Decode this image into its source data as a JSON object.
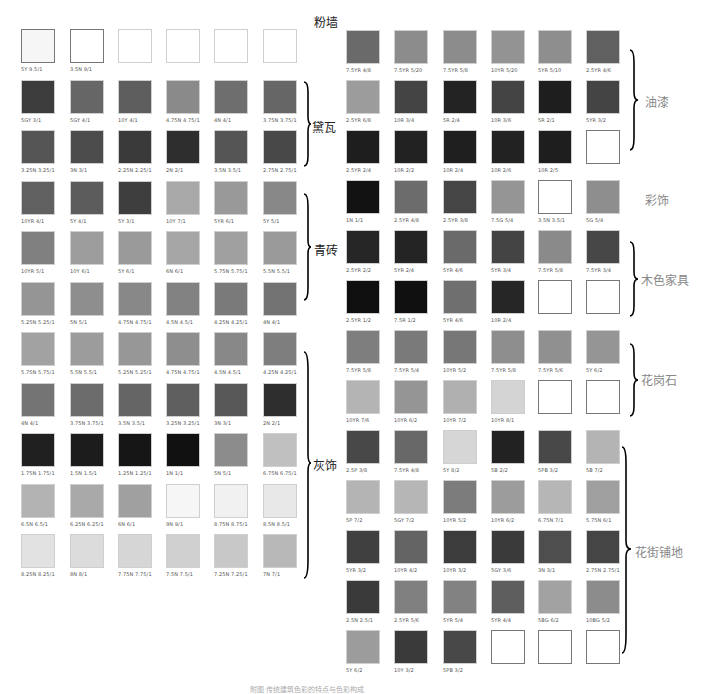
{
  "left_grid": {
    "rows": [
      [
        {
          "code": "5Y 9.5/1",
          "color": "#f6f6f6",
          "outlined": true
        },
        {
          "code": "3.5N 9/1",
          "color": "#ffffff",
          "outlined": true
        },
        {
          "code": "",
          "color": "#ffffff"
        },
        {
          "code": "",
          "color": "#ffffff"
        },
        {
          "code": "",
          "color": "#ffffff"
        },
        {
          "code": "",
          "color": "#ffffff"
        }
      ],
      [
        {
          "code": "5GY 3/1",
          "color": "#3c3c3c"
        },
        {
          "code": "5GY 4/1",
          "color": "#666666"
        },
        {
          "code": "10Y 4/1",
          "color": "#5e5e5e"
        },
        {
          "code": "4.75N 4.75/1",
          "color": "#8a8a8a"
        },
        {
          "code": "4N 4/1",
          "color": "#6e6e6e"
        },
        {
          "code": "3.75N 3.75/1",
          "color": "#666666"
        }
      ],
      [
        {
          "code": "3.25N 3.25/1",
          "color": "#555555"
        },
        {
          "code": "3N 3/1",
          "color": "#4c4c4c"
        },
        {
          "code": "2.25N 2.25/1",
          "color": "#3a3a3a"
        },
        {
          "code": "2N 2/1",
          "color": "#2e2e2e"
        },
        {
          "code": "3.5N 3.5/1",
          "color": "#555555"
        },
        {
          "code": "2.75N 2.75/1",
          "color": "#484848"
        }
      ],
      [
        {
          "code": "10YR 4/1",
          "color": "#606060"
        },
        {
          "code": "5Y 4/1",
          "color": "#5c5c5c"
        },
        {
          "code": "5Y 3/1",
          "color": "#3e3e3e"
        },
        {
          "code": "10Y 7/1",
          "color": "#a8a8a8"
        },
        {
          "code": "5YR 6/1",
          "color": "#999999"
        },
        {
          "code": "5Y 5/1",
          "color": "#888888"
        }
      ],
      [
        {
          "code": "10YR 5/1",
          "color": "#808080"
        },
        {
          "code": "10Y 6/1",
          "color": "#9d9d9d"
        },
        {
          "code": "5Y 6/1",
          "color": "#9a9a9a"
        },
        {
          "code": "6N 6/1",
          "color": "#a6a6a6"
        },
        {
          "code": "5.75N 5.75/1",
          "color": "#a0a0a0"
        },
        {
          "code": "5.5N 5.5/1",
          "color": "#9a9a9a"
        }
      ],
      [
        {
          "code": "5.25N 5.25/1",
          "color": "#959595"
        },
        {
          "code": "5N 5/1",
          "color": "#8e8e8e"
        },
        {
          "code": "4.75N 4.75/1",
          "color": "#888888"
        },
        {
          "code": "4.5N 4.5/1",
          "color": "#828282"
        },
        {
          "code": "4.25N 4.25/1",
          "color": "#7a7a7a"
        },
        {
          "code": "4N 4/1",
          "color": "#727272"
        }
      ],
      [
        {
          "code": "5.75N 5.75/1",
          "color": "#a2a2a2"
        },
        {
          "code": "5.5N 5.5/1",
          "color": "#9c9c9c"
        },
        {
          "code": "5.25N 5.25/1",
          "color": "#979797"
        },
        {
          "code": "4.75N 4.75/1",
          "color": "#8e8e8e"
        },
        {
          "code": "4.5N 4.5/1",
          "color": "#888888"
        },
        {
          "code": "4.25N 4.25/1",
          "color": "#7e7e7e"
        }
      ],
      [
        {
          "code": "4N 4/1",
          "color": "#747474"
        },
        {
          "code": "3.75N 3.75/1",
          "color": "#6c6c6c"
        },
        {
          "code": "3.5N 3.5/1",
          "color": "#656565"
        },
        {
          "code": "3.25N 3.25/1",
          "color": "#5f5f5f"
        },
        {
          "code": "3N 3/1",
          "color": "#575757"
        },
        {
          "code": "2N 2/1",
          "color": "#2e2e2e"
        }
      ],
      [
        {
          "code": "1.75N 1.75/1",
          "color": "#202020"
        },
        {
          "code": "1.5N 1.5/1",
          "color": "#1c1c1c"
        },
        {
          "code": "1.25N 1.25/1",
          "color": "#161616"
        },
        {
          "code": "1N 1/1",
          "color": "#111111"
        },
        {
          "code": "5N 5/1",
          "color": "#8c8c8c"
        },
        {
          "code": "6.75N 6.75/1",
          "color": "#c0c0c0"
        }
      ],
      [
        {
          "code": "6.5N 6.5/1",
          "color": "#b3b3b3"
        },
        {
          "code": "6.25N 6.25/1",
          "color": "#a9a9a9"
        },
        {
          "code": "6N 6/1",
          "color": "#a0a0a0"
        },
        {
          "code": "9N 9/1",
          "color": "#f6f6f6"
        },
        {
          "code": "8.75N 8.75/1",
          "color": "#f1f1f1"
        },
        {
          "code": "8.5N 8.5/1",
          "color": "#e8e8e8"
        }
      ],
      [
        {
          "code": "8.25N 8.25/1",
          "color": "#e2e2e2"
        },
        {
          "code": "8N 8/1",
          "color": "#dcdcdc"
        },
        {
          "code": "7.75N 7.75/1",
          "color": "#d6d6d6"
        },
        {
          "code": "7.5N 7.5/1",
          "color": "#d0d0d0"
        },
        {
          "code": "7.25N 7.25/1",
          "color": "#c8c8c8"
        },
        {
          "code": "7N 7/1",
          "color": "#b8b8b8"
        }
      ]
    ],
    "labels": [
      {
        "text": "粉墙",
        "row": 0
      },
      {
        "text": "黛瓦",
        "row": 1.5
      },
      {
        "text": "青砖",
        "row": 4
      },
      {
        "text": "灰饰",
        "row": 8
      }
    ]
  },
  "right_grid": {
    "rows": [
      [
        {
          "code": "7.5YR 4/8",
          "color": "#6a6a6a"
        },
        {
          "code": "7.5YR 5/20",
          "color": "#8c8c8c"
        },
        {
          "code": "7.5YR 5/8",
          "color": "#8c8c8c"
        },
        {
          "code": "10YR 5/20",
          "color": "#939393"
        },
        {
          "code": "5YR 5/10",
          "color": "#8e8e8e"
        },
        {
          "code": "2.5YR 4/6",
          "color": "#606060"
        }
      ],
      [
        {
          "code": "2.5YR 6/8",
          "color": "#9c9c9c"
        },
        {
          "code": "10R 3/4",
          "color": "#444444"
        },
        {
          "code": "5R 2/4",
          "color": "#232323"
        },
        {
          "code": "10R 3/6",
          "color": "#444444"
        },
        {
          "code": "5R 2/1",
          "color": "#1e1e1e"
        },
        {
          "code": "5YR 3/2",
          "color": "#444444"
        }
      ],
      [
        {
          "code": "2.5YR 2/4",
          "color": "#1e1e1e"
        },
        {
          "code": "10R 2/2",
          "color": "#222222"
        },
        {
          "code": "10R 2/4",
          "color": "#1f1f1f"
        },
        {
          "code": "10R 2/6",
          "color": "#222222"
        },
        {
          "code": "10R 2/5",
          "color": "#1e1e1e"
        },
        {
          "code": "",
          "color": "#ffffff",
          "outlined": true
        }
      ],
      [
        {
          "code": "1N 1/1",
          "color": "#121212"
        },
        {
          "code": "2.5YR 4/8",
          "color": "#6c6c6c"
        },
        {
          "code": "2.5YR 3/8",
          "color": "#454545"
        },
        {
          "code": "7.5G 5/4",
          "color": "#959595"
        },
        {
          "code": "3.5N 3.5/1",
          "color": "#ffffff",
          "outlined": true
        },
        {
          "code": "5G 5/4",
          "color": "#8e8e8e"
        }
      ],
      [
        {
          "code": "2.5YR 2/2",
          "color": "#262626"
        },
        {
          "code": "5YR 2/4",
          "color": "#242424"
        },
        {
          "code": "5YR 4/6",
          "color": "#6a6a6a"
        },
        {
          "code": "5YR 3/4",
          "color": "#444444"
        },
        {
          "code": "7.5YR 5/8",
          "color": "#8a8a8a"
        },
        {
          "code": "7.5YR 3/4",
          "color": "#474747"
        }
      ],
      [
        {
          "code": "2.5YR 1/2",
          "color": "#0f0f0f"
        },
        {
          "code": "7.5R 1/2",
          "color": "#101010"
        },
        {
          "code": "5YR 4/6",
          "color": "#6f6f6f"
        },
        {
          "code": "10R 2/4",
          "color": "#262626"
        },
        {
          "code": "",
          "color": "#ffffff",
          "outlined": true
        },
        {
          "code": "",
          "color": "#ffffff",
          "outlined": true
        }
      ],
      [
        {
          "code": "7.5YR 5/8",
          "color": "#7e7e7e"
        },
        {
          "code": "7.5YR 5/4",
          "color": "#7a7a7a"
        },
        {
          "code": "10YR 5/2",
          "color": "#777777"
        },
        {
          "code": "7.5YR 5/8",
          "color": "#8e8e8e"
        },
        {
          "code": "7.5YR 5/6",
          "color": "#909090"
        },
        {
          "code": "5Y 6/2",
          "color": "#959595"
        }
      ],
      [
        {
          "code": "10YR 7/6",
          "color": "#b4b4b4"
        },
        {
          "code": "10YR 6/2",
          "color": "#959595"
        },
        {
          "code": "10YR 7/2",
          "color": "#b0b0b0"
        },
        {
          "code": "10YR 8/1",
          "color": "#d4d4d4"
        },
        {
          "code": "",
          "color": "#ffffff",
          "outlined": true
        },
        {
          "code": "",
          "color": "#ffffff",
          "outlined": true
        }
      ],
      [
        {
          "code": "2.5P 3/8",
          "color": "#484848"
        },
        {
          "code": "7.5YR 4/8",
          "color": "#686868"
        },
        {
          "code": "5Y 8/2",
          "color": "#d6d6d6"
        },
        {
          "code": "5B 2/2",
          "color": "#222222"
        },
        {
          "code": "5PB 3/2",
          "color": "#484848"
        },
        {
          "code": "5B 7/2",
          "color": "#b4b4b4"
        }
      ],
      [
        {
          "code": "5P 7/2",
          "color": "#b4b4b4"
        },
        {
          "code": "5GY 7/2",
          "color": "#b6b6b6"
        },
        {
          "code": "10YR 5/2",
          "color": "#7c7c7c"
        },
        {
          "code": "10YR 6/2",
          "color": "#9c9c9c"
        },
        {
          "code": "6.75N 7/1",
          "color": "#b6b6b6"
        },
        {
          "code": "5.75N 6/1",
          "color": "#9f9f9f"
        }
      ],
      [
        {
          "code": "5YR 3/2",
          "color": "#404040"
        },
        {
          "code": "10YR 4/2",
          "color": "#646464"
        },
        {
          "code": "10YR 3/2",
          "color": "#3c3c3c"
        },
        {
          "code": "5GY 3/6",
          "color": "#3a3a3a"
        },
        {
          "code": "3N 3/1",
          "color": "#4e4e4e"
        },
        {
          "code": "2.75N 2.75/1",
          "color": "#454545"
        }
      ],
      [
        {
          "code": "2.5N 2.5/1",
          "color": "#3a3a3a"
        },
        {
          "code": "2.5YR 5/6",
          "color": "#808080"
        },
        {
          "code": "5YR 5/4",
          "color": "#828282"
        },
        {
          "code": "5YR 4/4",
          "color": "#5e5e5e"
        },
        {
          "code": "5BG 6/2",
          "color": "#a2a2a2"
        },
        {
          "code": "10BG 5/2",
          "color": "#8c8c8c"
        }
      ],
      [
        {
          "code": "5Y 6/2",
          "color": "#9c9c9c"
        },
        {
          "code": "10Y 3/2",
          "color": "#3a3a3a"
        },
        {
          "code": "5PB 3/2",
          "color": "#484848"
        },
        {
          "code": "",
          "color": "#ffffff",
          "outlined": true
        },
        {
          "code": "",
          "color": "#ffffff",
          "outlined": true
        },
        {
          "code": "",
          "color": "#ffffff",
          "outlined": true
        }
      ]
    ],
    "labels": [
      {
        "text": "油漆",
        "row": 1
      },
      {
        "text": "彩饰",
        "row": 3
      },
      {
        "text": "木色家具",
        "row": 4.5
      },
      {
        "text": "花岗石",
        "row": 6.5
      },
      {
        "text": "花街铺地",
        "row": 10
      }
    ]
  },
  "caption": "附图  传统建筑色彩的特点与色彩构成"
}
